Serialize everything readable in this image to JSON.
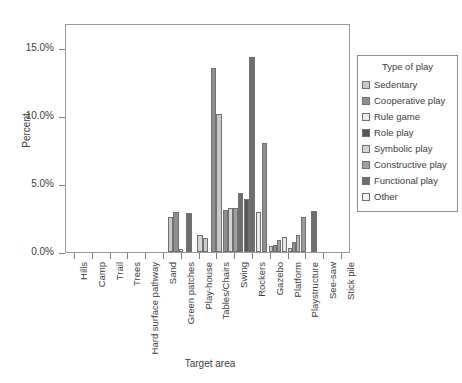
{
  "chart_data": {
    "type": "bar",
    "title": "",
    "xlabel": "Target area",
    "ylabel": "Percent",
    "ylim": [
      0,
      16.8
    ],
    "ytick_values": [
      0,
      5,
      10,
      15
    ],
    "ytick_labels": [
      "0.0%",
      "5.0%",
      "10.0%",
      "15.0%"
    ],
    "grid": false,
    "legend_position": "right",
    "legend_title": "Type of play",
    "categories": [
      "Hills",
      "Camp",
      "Trail",
      "Trees",
      "Hard surface pathway",
      "Sand",
      "Green patches",
      "Play-house",
      "Tables/Chairs",
      "Swing",
      "Rockers",
      "Gazebo",
      "Platform",
      "Playstructure",
      "See-saw",
      "Stick pile"
    ],
    "series": [
      {
        "name": "Sedentary",
        "color": "#c9c9c9",
        "values": [
          0,
          0,
          0,
          2.6,
          0,
          1.0,
          2.8,
          0,
          0.45,
          0,
          0,
          0,
          0,
          0.55,
          0,
          0
        ]
      },
      {
        "name": "Cooperative play",
        "color": "#8f8f8f",
        "values": [
          0,
          0,
          0,
          2.95,
          0,
          13.5,
          3.5,
          2.9,
          0.5,
          0,
          0,
          0,
          0,
          2.7,
          0,
          0
        ]
      },
      {
        "name": "Rule game",
        "color": "#e8e8e8",
        "values": [
          0,
          0,
          0,
          0.25,
          0,
          10.1,
          3.0,
          0,
          0.9,
          0,
          0,
          0,
          0,
          0.2,
          0,
          0
        ]
      },
      {
        "name": "Role play",
        "color": "#585858",
        "values": [
          0,
          0,
          0,
          0,
          1.25,
          3.1,
          3.9,
          0,
          0.3,
          0,
          0,
          0,
          0,
          1.0,
          0,
          0
        ]
      },
      {
        "name": "Symbolic play",
        "color": "#d4d4d4",
        "values": [
          0,
          0,
          0,
          0,
          0,
          3.2,
          2.95,
          0,
          0.35,
          0,
          0,
          0,
          0,
          0.2,
          0,
          0
        ]
      },
      {
        "name": "Constructive play",
        "color": "#a0a0a0",
        "values": [
          0,
          0,
          0,
          0,
          0,
          3.25,
          6.0,
          0,
          0.75,
          0,
          0,
          0,
          0,
          2.35,
          0,
          0
        ]
      },
      {
        "name": "Functional play",
        "color": "#6e6e6e",
        "values": [
          0,
          0,
          0,
          2.85,
          0,
          4.35,
          14.3,
          8.0,
          1.1,
          2.6,
          0,
          0,
          0,
          0,
          0.5,
          0
        ]
      },
      {
        "name": "Other",
        "color": "#f2f2f2",
        "values": [
          0,
          0,
          0,
          0,
          0,
          0,
          2.9,
          0,
          0.7,
          0,
          0,
          0,
          0,
          0,
          0,
          0
        ]
      }
    ],
    "bars_layout": [
      {
        "x": 166.5,
        "w": 5.5,
        "h": 2.6,
        "c": "#c9c9c9",
        "n": "trees-sedentary"
      },
      {
        "x": 172.0,
        "w": 5.5,
        "h": 2.95,
        "c": "#8f8f8f",
        "n": "trees-cooperative"
      },
      {
        "x": 177.5,
        "w": 4.0,
        "h": 0.25,
        "c": "#e8e8e8",
        "n": "trees-rule-game"
      },
      {
        "x": 185.0,
        "w": 5.5,
        "h": 2.85,
        "c": "#6e6e6e",
        "n": "trees-functional"
      },
      {
        "x": 196.0,
        "w": 5.5,
        "h": 1.25,
        "c": "#d4d4d4",
        "n": "hardsurface-symbolic"
      },
      {
        "x": 201.5,
        "w": 5.0,
        "h": 1.0,
        "c": "#c9c9c9",
        "n": "hardsurface-sedentary"
      },
      {
        "x": 209.5,
        "w": 5.5,
        "h": 13.5,
        "c": "#8f8f8f",
        "n": "sand-cooperative"
      },
      {
        "x": 215.0,
        "w": 5.5,
        "h": 10.1,
        "c": "#c9c9c9",
        "n": "sand-sedentary"
      },
      {
        "x": 222.0,
        "w": 5.0,
        "h": 3.1,
        "c": "#8f8f8f",
        "n": "sand-role"
      },
      {
        "x": 227.0,
        "w": 5.0,
        "h": 3.2,
        "c": "#d4d4d4",
        "n": "sand-symbolic"
      },
      {
        "x": 232.0,
        "w": 5.0,
        "h": 3.25,
        "c": "#a0a0a0",
        "n": "sand-constructive"
      },
      {
        "x": 237.0,
        "w": 5.0,
        "h": 4.35,
        "c": "#6e6e6e",
        "n": "sand-functional"
      },
      {
        "x": 242.5,
        "w": 5.5,
        "h": 3.9,
        "c": "#585858",
        "n": "greenpatch-role"
      },
      {
        "x": 248.0,
        "w": 5.5,
        "h": 14.3,
        "c": "#6e6e6e",
        "n": "greenpatch-functional"
      },
      {
        "x": 254.5,
        "w": 5.5,
        "h": 2.9,
        "c": "#e8e8e8",
        "n": "greenpatch-rule"
      },
      {
        "x": 260.5,
        "w": 5.5,
        "h": 8.0,
        "c": "#8f8f8f",
        "n": "playhouse-functional"
      },
      {
        "x": 267.5,
        "w": 4.0,
        "h": 0.45,
        "c": "#c9c9c9",
        "n": "tables-sedentary"
      },
      {
        "x": 271.5,
        "w": 4.0,
        "h": 0.5,
        "c": "#8f8f8f",
        "n": "tables-cooperative"
      },
      {
        "x": 275.5,
        "w": 4.5,
        "h": 0.9,
        "c": "#a0a0a0",
        "n": "tables-rule"
      },
      {
        "x": 281.0,
        "w": 4.5,
        "h": 1.1,
        "c": "#e8e8e8",
        "n": "tables-other"
      },
      {
        "x": 286.5,
        "w": 4.0,
        "h": 0.3,
        "c": "#d4d4d4",
        "n": "tables-symbolic"
      },
      {
        "x": 290.5,
        "w": 4.0,
        "h": 0.75,
        "c": "#8f8f8f",
        "n": "tables-constructive"
      },
      {
        "x": 294.5,
        "w": 4.5,
        "h": 1.25,
        "c": "#b4b4b4",
        "n": "swing-misc"
      },
      {
        "x": 299.5,
        "w": 5.0,
        "h": 2.6,
        "c": "#9b9b9b",
        "n": "swing-functional"
      },
      {
        "x": 310.0,
        "w": 5.5,
        "h": 3.0,
        "c": "#6e6e6e",
        "n": "rockers-functional"
      },
      {
        "x": 368.0,
        "w": 5.0,
        "h": 0.55,
        "c": "#e0e0e0",
        "n": "playstructure-sedentary"
      },
      {
        "x": 376.5,
        "w": 5.5,
        "h": 2.7,
        "c": "#6e6e6e",
        "n": "playstructure-cooperative"
      },
      {
        "x": 382.0,
        "w": 5.0,
        "h": 1.0,
        "c": "#b8b8b8",
        "n": "playstructure-role"
      },
      {
        "x": 387.0,
        "w": 4.0,
        "h": 0.2,
        "c": "#d8d8d8",
        "n": "playstructure-rule"
      },
      {
        "x": 392.5,
        "w": 5.5,
        "h": 2.35,
        "c": "#8f8f8f",
        "n": "seesaw-constructive"
      },
      {
        "x": 404.0,
        "w": 5.0,
        "h": 0.5,
        "c": "#6e6e6e",
        "n": "stickpile-functional"
      }
    ]
  }
}
